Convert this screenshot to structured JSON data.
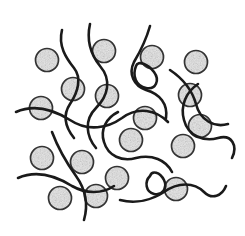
{
  "figure": {
    "caption": "Stippled spherical filler particles dispersed within an entangled polymer chain network",
    "width": 245,
    "height": 236,
    "background_color": "#ffffff"
  },
  "scan_artifact": {
    "name": "cropped-text-remnant",
    "description": "Faint illegible remnant of a cut-off line of text along the top edge of the scan",
    "visible": true,
    "opacity": 0.55,
    "color": "#8c8c8c",
    "marks": [
      {
        "x": 2,
        "w": 7,
        "h": 3
      },
      {
        "x": 12,
        "w": 4,
        "h": 2
      },
      {
        "x": 20,
        "w": 9,
        "h": 3
      },
      {
        "x": 33,
        "w": 5,
        "h": 2
      },
      {
        "x": 42,
        "w": 12,
        "h": 3
      },
      {
        "x": 58,
        "w": 4,
        "h": 2
      },
      {
        "x": 66,
        "w": 8,
        "h": 3
      },
      {
        "x": 79,
        "w": 5,
        "h": 2
      },
      {
        "x": 88,
        "w": 10,
        "h": 3
      },
      {
        "x": 103,
        "w": 4,
        "h": 2
      },
      {
        "x": 111,
        "w": 7,
        "h": 3
      },
      {
        "x": 123,
        "w": 5,
        "h": 2
      },
      {
        "x": 132,
        "w": 11,
        "h": 3
      },
      {
        "x": 147,
        "w": 4,
        "h": 2
      },
      {
        "x": 155,
        "w": 9,
        "h": 3
      },
      {
        "x": 168,
        "w": 5,
        "h": 2
      },
      {
        "x": 177,
        "w": 8,
        "h": 3
      },
      {
        "x": 190,
        "w": 4,
        "h": 2
      },
      {
        "x": 198,
        "w": 10,
        "h": 3
      },
      {
        "x": 213,
        "w": 5,
        "h": 2
      },
      {
        "x": 222,
        "w": 7,
        "h": 3
      },
      {
        "x": 234,
        "w": 6,
        "h": 2
      }
    ]
  },
  "chart_data": {
    "type": "scatter",
    "xlabel": "",
    "ylabel": "",
    "xlim": [
      0,
      245
    ],
    "ylim": [
      0,
      236
    ],
    "grid": false,
    "legend": null,
    "annotations": [],
    "series": [
      {
        "name": "Filler particles",
        "marker": "circle",
        "fill_style": "stipple",
        "fill_color": "#b8b8b8",
        "stroke_color": "#333333",
        "radius": 11.5,
        "count": 18,
        "points": [
          {
            "id": "p01",
            "x": 47,
            "y": 60
          },
          {
            "id": "p02",
            "x": 104,
            "y": 51
          },
          {
            "id": "p03",
            "x": 152,
            "y": 57
          },
          {
            "id": "p04",
            "x": 196,
            "y": 62
          },
          {
            "id": "p05",
            "x": 73,
            "y": 89
          },
          {
            "id": "p06",
            "x": 107,
            "y": 96
          },
          {
            "id": "p07",
            "x": 190,
            "y": 95
          },
          {
            "id": "p08",
            "x": 41,
            "y": 108
          },
          {
            "id": "p09",
            "x": 131,
            "y": 140
          },
          {
            "id": "p10",
            "x": 183,
            "y": 146
          },
          {
            "id": "p11",
            "x": 42,
            "y": 158
          },
          {
            "id": "p12",
            "x": 82,
            "y": 162
          },
          {
            "id": "p13",
            "x": 117,
            "y": 178
          },
          {
            "id": "p14",
            "x": 176,
            "y": 189
          },
          {
            "id": "p15",
            "x": 60,
            "y": 198
          },
          {
            "id": "p16",
            "x": 96,
            "y": 196
          },
          {
            "id": "p17",
            "x": 145,
            "y": 118
          },
          {
            "id": "p18",
            "x": 200,
            "y": 126
          }
        ]
      },
      {
        "name": "Polymer chains",
        "marker": "freeform-curve",
        "stroke_color": "#1a1a1a",
        "stroke_width": 2.6,
        "count": 12,
        "paths": [
          "M 62 30 C 58 46, 66 58, 74 68 C 82 78, 78 92, 70 104 C 62 116, 66 128, 74 138",
          "M 90 24 C 86 42, 92 56, 100 66 C 112 80, 108 96, 96 108 C 84 120, 86 136, 96 148",
          "M 150 26 C 146 40, 140 52, 134 62 C 128 74, 134 86, 146 90 C 160 94, 168 104, 166 118",
          "M 16 112 C 34 104, 54 110, 70 120 C 88 132, 108 128, 122 118 C 138 106, 156 110, 168 122",
          "M 118 112 C 106 118, 100 130, 104 142 C 108 156, 122 162, 136 158 C 152 154, 166 160, 172 172",
          "M 18 178 C 36 170, 56 176, 72 186 C 86 194, 102 194, 114 186",
          "M 52 132 C 58 148, 66 162, 76 176 C 86 190, 88 206, 84 220",
          "M 170 70 C 182 78, 192 90, 196 104 C 200 120, 214 128, 228 124",
          "M 198 84 C 186 92, 180 106, 184 120 C 188 136, 204 142, 218 138 C 232 134, 238 146, 232 158",
          "M 120 200 C 136 204, 152 200, 164 192 C 178 182, 194 182, 204 192 C 212 200, 222 196, 226 186",
          "M 136 66 C 132 76, 136 86, 146 88 C 156 90, 160 80, 154 72 C 148 64, 138 60, 136 66",
          "M 150 176 C 144 182, 146 192, 154 194 C 162 196, 168 188, 164 180 C 160 172, 152 170, 150 176"
        ]
      }
    ]
  }
}
